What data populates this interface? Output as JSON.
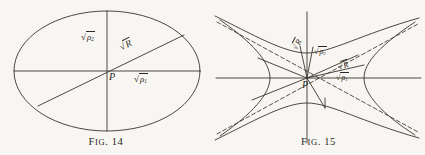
{
  "page": {
    "background_color": "#f7f6f2",
    "ink_color": "#2b2721",
    "width": 425,
    "height": 155
  },
  "figures": [
    {
      "id": "fig-14",
      "caption_prefix": "F",
      "caption_smallcaps": "IG.",
      "caption_number": "14",
      "caption_full": "Fig. 14",
      "shape": "ellipse",
      "center_label": "P",
      "labels": [
        {
          "name": "sqrt-rho-2",
          "radical": "√",
          "base": "ρ",
          "sub": "2",
          "text": "√ρ₂",
          "rotation": 0
        },
        {
          "name": "sqrt-R",
          "radical": "√",
          "base": "R",
          "sub": "",
          "text": "√R",
          "rotation": -27
        },
        {
          "name": "sqrt-rho-1",
          "radical": "√",
          "base": "ρ",
          "sub": "1",
          "text": "√ρ₁",
          "rotation": 0
        }
      ]
    },
    {
      "id": "fig-15",
      "caption_prefix": "F",
      "caption_smallcaps": "IG.",
      "caption_number": "15",
      "caption_full": "Fig. 15",
      "shape": "hyperbola",
      "center_label": "P",
      "labels": [
        {
          "name": "sqrt-R-upper",
          "radical": "√",
          "base": "R",
          "sub": "",
          "text": "√R",
          "rotation": -62
        },
        {
          "name": "sqrt-rho-2",
          "radical": "√",
          "base": "ρ",
          "sub": "2",
          "text": "√ρ₂",
          "rotation": 0
        },
        {
          "name": "sqrt-R-right",
          "radical": "√",
          "base": "R",
          "sub": "",
          "text": "√R",
          "rotation": -18
        },
        {
          "name": "sqrt-rho-1",
          "radical": "√",
          "base": "ρ",
          "sub": "1",
          "text": "√ρ₁",
          "rotation": 0
        }
      ]
    }
  ]
}
